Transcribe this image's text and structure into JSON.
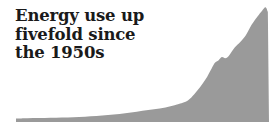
{
  "figure": {
    "width": 279,
    "height": 133,
    "background_color": "#ffffff"
  },
  "headline": {
    "lines": [
      "Energy use up",
      "fivefold since",
      "the 1950s"
    ],
    "full_text": "Energy use up fivefold since the 1950s",
    "color": "#1a1a1a"
  },
  "chart_data": {
    "type": "area",
    "title": "Energy use up fivefold since the 1950s",
    "xlabel": "",
    "ylabel": "",
    "legend": [],
    "grid": false,
    "axes_visible": false,
    "tick_labels_x": [],
    "tick_labels_y": [],
    "fill_color": "#9a9a9a",
    "baseline_color": "#9a9a9a",
    "xlim": [
      1800,
      2020
    ],
    "ylim": [
      0,
      100
    ],
    "x": [
      1800,
      1810,
      1820,
      1830,
      1840,
      1850,
      1860,
      1870,
      1880,
      1890,
      1900,
      1910,
      1920,
      1930,
      1940,
      1945,
      1950,
      1955,
      1960,
      1965,
      1970,
      1973,
      1976,
      1979,
      1982,
      1985,
      1990,
      1995,
      2000,
      2005,
      2010,
      2014,
      2017,
      2019
    ],
    "values": [
      3.0,
      3.2,
      3.4,
      3.6,
      3.9,
      4.2,
      4.6,
      5.2,
      6.0,
      7.0,
      8.2,
      9.8,
      11.0,
      12.5,
      15.0,
      16.5,
      19.0,
      24.0,
      30.0,
      37.0,
      46.0,
      51.0,
      53.0,
      56.0,
      55.0,
      57.0,
      64.0,
      69.0,
      75.0,
      84.0,
      91.0,
      96.0,
      99.0,
      95.0
    ],
    "series": [
      {
        "name": "Global energy use",
        "values": [
          3.0,
          3.2,
          3.4,
          3.6,
          3.9,
          4.2,
          4.6,
          5.2,
          6.0,
          7.0,
          8.2,
          9.8,
          11.0,
          12.5,
          15.0,
          16.5,
          19.0,
          24.0,
          30.0,
          37.0,
          46.0,
          51.0,
          53.0,
          56.0,
          55.0,
          57.0,
          64.0,
          69.0,
          75.0,
          84.0,
          91.0,
          96.0,
          99.0,
          95.0
        ]
      }
    ],
    "plot_box": {
      "left": 16,
      "right": 269,
      "top": 6,
      "bottom": 122
    }
  }
}
